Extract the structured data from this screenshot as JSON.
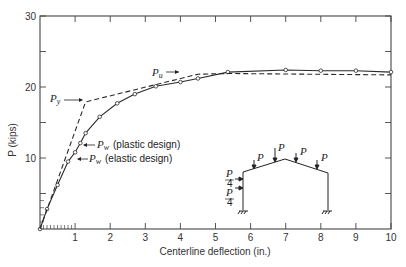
{
  "chart_data": {
    "type": "line",
    "title": "",
    "xlabel": "Centerline deflection (in.)",
    "ylabel": "P (kips)",
    "xlim": [
      0,
      10
    ],
    "ylim": [
      0,
      30
    ],
    "x_ticks": [
      1,
      2,
      3,
      4,
      5,
      6,
      7,
      8,
      9,
      10
    ],
    "y_ticks": [
      10,
      20,
      30
    ],
    "y_minor_ticks": [
      5,
      15,
      25
    ],
    "grid": false,
    "series": [
      {
        "name": "Experimental (solid, circle markers)",
        "style": "solid",
        "marker": "open-circle",
        "x": [
          0,
          0.2,
          0.5,
          0.8,
          1.0,
          1.15,
          1.3,
          1.7,
          2.2,
          2.7,
          3.3,
          4.0,
          4.5,
          5.35,
          7.0,
          8.0,
          9.0,
          10.0
        ],
        "y": [
          0,
          2.8,
          6.2,
          9.5,
          10.8,
          12.1,
          13.5,
          15.8,
          17.7,
          19.0,
          20.1,
          20.7,
          21.2,
          22.1,
          22.4,
          22.3,
          22.3,
          22.1
        ]
      },
      {
        "name": "Theoretical (dashed)",
        "style": "dashed",
        "marker": "none",
        "x": [
          0,
          1.3,
          4.5,
          5.35,
          10.0
        ],
        "y": [
          0,
          17.9,
          21.8,
          21.9,
          21.7
        ]
      }
    ],
    "annotations": [
      {
        "text": "P_u",
        "x": 3.0,
        "y": 23.0,
        "arrow": "right"
      },
      {
        "text": "P_y",
        "x": 0.0,
        "y": 18.5,
        "arrow": "right"
      },
      {
        "text": "P_w (plastic design)",
        "x": 1.2,
        "y": 12.0,
        "arrow": "left"
      },
      {
        "text": "P_w (elastic design)",
        "x": 1.0,
        "y": 10.5,
        "arrow": "left"
      }
    ],
    "inset": {
      "description": "Gable frame with loads",
      "roof_loads": [
        "P",
        "P",
        "P",
        "P"
      ],
      "side_loads": [
        "P/4",
        "P/4"
      ]
    }
  },
  "labels": {
    "xlabel": "Centerline deflection (in.)",
    "ylabel": "P (kips)",
    "pu": "P",
    "pu_sub": "u",
    "py": "P",
    "py_sub": "y",
    "pw": "P",
    "pw_sub": "w",
    "plastic": "(plastic design)",
    "elastic": "(elastic design)",
    "inset_p": "P",
    "inset_four": "4"
  },
  "colors": {
    "line": "#2a2a2a",
    "axis": "#444444",
    "background": "#ffffff"
  }
}
